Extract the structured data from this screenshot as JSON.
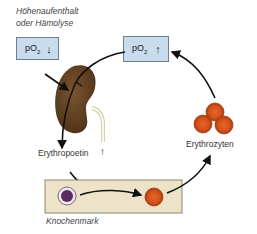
{
  "diagram": {
    "type": "feedback-cycle",
    "labels": {
      "trigger_line1": "Höhenaufenthalt",
      "trigger_line2": "oder Hämolyse",
      "po2_low": "pO",
      "po2_low_sub": "2",
      "po2_low_arrow": "↓",
      "po2_high": "pO",
      "po2_high_sub": "2",
      "po2_high_arrow": "↑",
      "epo": "Erythropoetin",
      "epo_arrow": "↑",
      "erythrocytes": "Erythrozyten",
      "bone_marrow": "Knochenmark"
    },
    "nodes": [
      "pO2 low box",
      "kidney",
      "Erythropoetin",
      "Knochenmark",
      "Erythrozyten",
      "pO2 high box"
    ],
    "colors": {
      "box_fill": "#c9dced",
      "kidney": "#5a3b1c",
      "marrow_fill": "#ede3c8",
      "rbc": "#d9541c",
      "precursor": "#5b2a5e",
      "arrow": "#111111"
    }
  }
}
